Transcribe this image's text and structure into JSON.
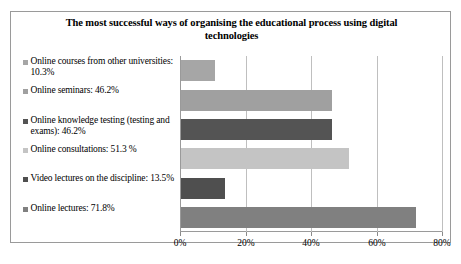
{
  "chart_data": {
    "type": "bar",
    "orientation": "horizontal",
    "title": "The most successful ways of organising the educational process using digital technologies",
    "xlabel": "",
    "ylabel": "",
    "xlim": [
      0,
      80
    ],
    "grid": true,
    "legend_position": "left",
    "tick_labels": [
      "0%",
      "20%",
      "40%",
      "60%",
      "80%"
    ],
    "tick_values": [
      0,
      20,
      40,
      60,
      80
    ],
    "categories": [
      "Online courses from other universities",
      "Online seminars",
      "Online knowledge testing (testing and exams)",
      "Online consultations",
      "Video lectures on the discipline",
      "Online lectures"
    ],
    "values": [
      10.3,
      46.2,
      46.2,
      51.3,
      13.5,
      71.8
    ],
    "legend_entries": [
      "Online courses from other universities: 10.3%",
      "Online seminars: 46.2%",
      "Online knowledge testing (testing and exams): 46.2%",
      "Online consultations: 51.3 %",
      "Video lectures on the discipline: 13.5%",
      "Online lectures: 71.8%"
    ],
    "colors": [
      "#a6a6a6",
      "#a0a0a0",
      "#545454",
      "#c4c4c4",
      "#4f4f4f",
      "#808080"
    ]
  }
}
